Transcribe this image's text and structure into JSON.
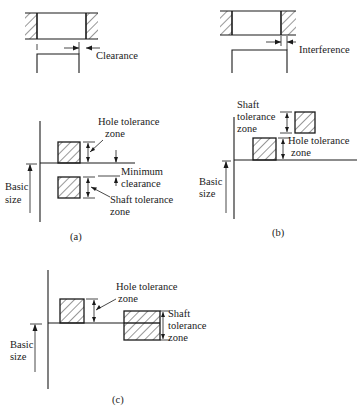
{
  "figure": {
    "colors": {
      "ink": "#1a1a1a",
      "background": "#ffffff"
    },
    "panel_a": {
      "callout_top": "Clearance",
      "hole_zone_label_1": "Hole tolerance",
      "hole_zone_label_2": "zone",
      "min_clearance_label_1": "Minimum",
      "min_clearance_label_2": "clearance",
      "shaft_zone_label_1": "Shaft tolerance",
      "shaft_zone_label_2": "zone",
      "basic_size_label_1": "Basic",
      "basic_size_label_2": "size",
      "caption": "(a)"
    },
    "panel_b": {
      "callout_top": "Interference",
      "shaft_zone_label_1": "Shaft",
      "shaft_zone_label_2": "tolerance",
      "shaft_zone_label_3": "zone",
      "hole_zone_label_1": "Hole tolerance",
      "hole_zone_label_2": "zone",
      "basic_size_label_1": "Basic",
      "basic_size_label_2": "size",
      "caption": "(b)"
    },
    "panel_c": {
      "hole_zone_label_1": "Hole tolerance",
      "hole_zone_label_2": "zone",
      "shaft_zone_label_1": "Shaft",
      "shaft_zone_label_2": "tolerance",
      "shaft_zone_label_3": "zone",
      "basic_size_label_1": "Basic",
      "basic_size_label_2": "size",
      "caption": "(c)"
    }
  }
}
